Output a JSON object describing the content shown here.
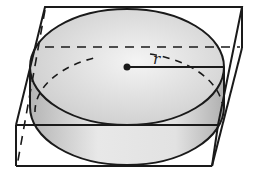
{
  "diagram": {
    "radius_label": "r",
    "colors": {
      "stroke": "#1a1a1a",
      "cylinder_fill_light": "#efefef",
      "cylinder_fill_dark": "#bdbdbd",
      "background": "#ffffff"
    }
  }
}
